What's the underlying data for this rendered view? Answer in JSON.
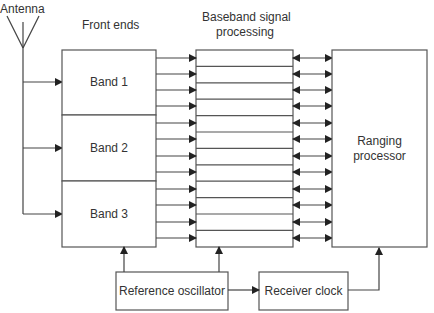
{
  "diagram": {
    "labels": {
      "antenna": "Antenna",
      "front_ends": "Front ends",
      "baseband_line1": "Baseband signal",
      "baseband_line2": "processing"
    },
    "bands": [
      {
        "label": "Band 1"
      },
      {
        "label": "Band 2"
      },
      {
        "label": "Band 3"
      }
    ],
    "ranging_processor": {
      "line1": "Ranging",
      "line2": "processor"
    },
    "reference_oscillator": {
      "label": "Reference oscillator"
    },
    "receiver_clock": {
      "label": "Receiver clock"
    },
    "channels_per_band": 4,
    "total_channels": 12,
    "colors": {
      "line": "#333333",
      "background": "#ffffff"
    }
  }
}
